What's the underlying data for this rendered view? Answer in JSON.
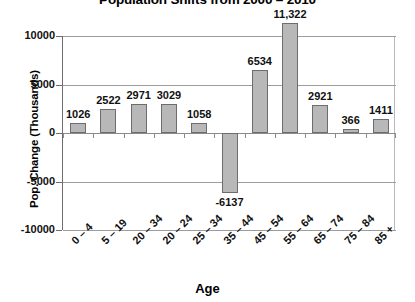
{
  "chart_data": {
    "type": "bar",
    "title": "Population Shifts from 2000 – 2010",
    "xlabel": "Age",
    "ylabel": "Pop. Change (Thousands)",
    "categories": [
      "0 – 4",
      "5 – 19",
      "20 – 34",
      "20 – 24",
      "25 – 34",
      "35 – 44",
      "45 – 54",
      "55 – 64",
      "65 – 74",
      "75 – 84",
      "85 +"
    ],
    "values": [
      1026,
      2522,
      2971,
      3029,
      1058,
      -6137,
      6534,
      11322,
      2921,
      366,
      1411
    ],
    "value_labels": [
      "1026",
      "2522",
      "2971",
      "3029",
      "1058",
      "-6137",
      "6534",
      "11,322",
      "2921",
      "366",
      "1411"
    ],
    "ylim": [
      -10000,
      10000
    ],
    "ytick_values": [
      10000,
      5000,
      0,
      -5000,
      -10000
    ],
    "ytick_labels": [
      "10000",
      "5000",
      "0",
      "-5000",
      "-10000"
    ],
    "grid": true,
    "legend": null,
    "bar_color": "#b8b8b8",
    "bar_border_color": "#6d6d6d",
    "gridline_color": "#9c9c9c",
    "axis_color": "#6e6e6e"
  }
}
